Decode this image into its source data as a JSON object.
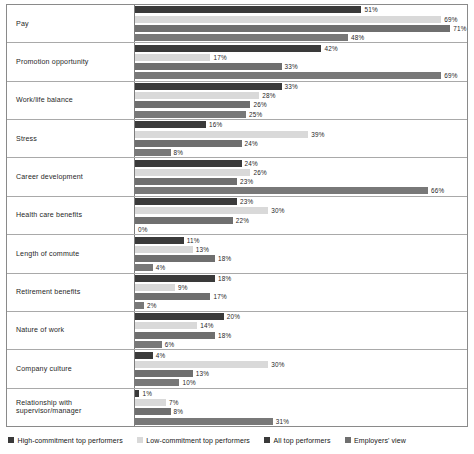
{
  "chart_data": {
    "type": "bar",
    "orientation": "horizontal",
    "title": "",
    "subtitle": "",
    "xlabel": "",
    "ylabel": "",
    "xlim": [
      0,
      75
    ],
    "grid": false,
    "legend_position": "bottom",
    "value_suffix": "%",
    "categories": [
      "Pay",
      "Promotion opportunity",
      "Work/life balance",
      "Stress",
      "Career development",
      "Health care benefits",
      "Length of commute",
      "Retirement benefits",
      "Nature of work",
      "Company culture",
      "Relationship with supervisor/manager"
    ],
    "series": [
      {
        "name": "High-commitment top performers",
        "color": "#3a3a3a",
        "values": [
          51,
          42,
          33,
          16,
          24,
          23,
          11,
          18,
          20,
          4,
          1
        ],
        "labels": [
          "51%",
          "42%",
          "33%",
          "16%",
          "24%",
          "23%",
          "11%",
          "18%",
          "20%",
          "4%",
          "1%"
        ]
      },
      {
        "name": "Low-commitment top performers",
        "color": "#d9d9d9",
        "values": [
          69,
          17,
          28,
          39,
          26,
          30,
          13,
          9,
          14,
          30,
          7
        ],
        "labels": [
          "69%",
          "17%",
          "28%",
          "39%",
          "26%",
          "30%",
          "13%",
          "9%",
          "14%",
          "30%",
          "7%"
        ]
      },
      {
        "name": "All top performers",
        "color": "#6f6f6f",
        "values": [
          71,
          33,
          26,
          24,
          23,
          22,
          18,
          17,
          18,
          13,
          8
        ],
        "labels": [
          "71%",
          "33%",
          "26%",
          "24%",
          "23%",
          "22%",
          "18%",
          "17%",
          "18%",
          "13%",
          "8%"
        ]
      },
      {
        "name": "Employers' view",
        "color": "#787878",
        "values": [
          48,
          69,
          25,
          8,
          66,
          0,
          4,
          2,
          6,
          10,
          31
        ],
        "labels": [
          "48%",
          "69%",
          "25%",
          "8%",
          "66%",
          "0%",
          "4%",
          "2%",
          "6%",
          "10%",
          "31%"
        ]
      }
    ]
  },
  "legend": {
    "items": [
      {
        "label": "High-commitment top performers",
        "color": "#3a3a3a"
      },
      {
        "label": "Low-commitment top performers",
        "color": "#d9d9d9"
      },
      {
        "label": "All top performers",
        "color": "#3a3a3a"
      },
      {
        "label": "Employers' view",
        "color": "#6f6f6f"
      }
    ]
  }
}
